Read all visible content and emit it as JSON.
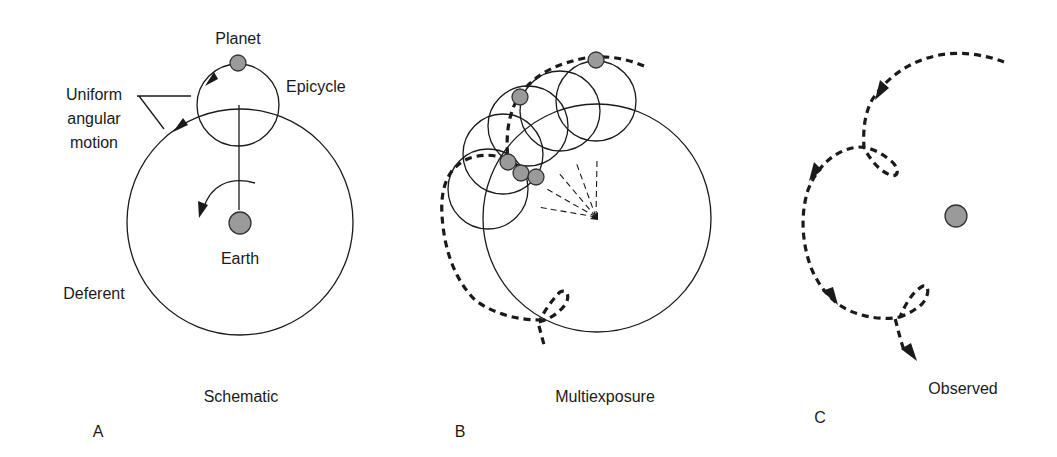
{
  "figure": {
    "panels": [
      {
        "id": "A",
        "letter": "A",
        "caption": "Schematic",
        "labels": {
          "planet": "Planet",
          "epicycle": "Epicycle",
          "uniform_line1": "Uniform",
          "uniform_line2": "angular",
          "uniform_line3": "motion",
          "earth": "Earth",
          "deferent": "Deferent"
        }
      },
      {
        "id": "B",
        "letter": "B",
        "caption": "Multiexposure"
      },
      {
        "id": "C",
        "letter": "C",
        "caption": "Observed"
      }
    ],
    "colors": {
      "line": "#1a1a1a",
      "body_fill": "#9a9a9a",
      "background": "#ffffff"
    }
  }
}
